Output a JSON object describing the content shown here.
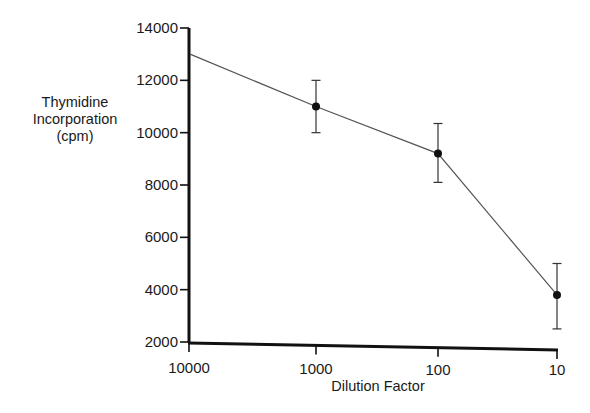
{
  "chart_data": {
    "type": "line",
    "title": "",
    "xlabel": "Dilution Factor",
    "ylabel": [
      "Thymidine",
      "Incorporation",
      "(cpm)"
    ],
    "categories": [
      "10000",
      "1000",
      "100",
      "10"
    ],
    "series": [
      {
        "name": "Thymidine Incorporation",
        "values": [
          13000,
          11000,
          9200,
          3800
        ],
        "error_low": [
          null,
          10000,
          8100,
          2500
        ],
        "error_high": [
          null,
          12000,
          10350,
          5000
        ],
        "markers": [
          false,
          true,
          true,
          true
        ]
      }
    ],
    "ylim": [
      2000,
      14000
    ],
    "yticks": [
      2000,
      4000,
      6000,
      8000,
      10000,
      12000,
      14000
    ],
    "grid": false,
    "legend": "none",
    "colors": {
      "axis": "#111111",
      "line": "#555555",
      "marker": "#111111"
    }
  }
}
